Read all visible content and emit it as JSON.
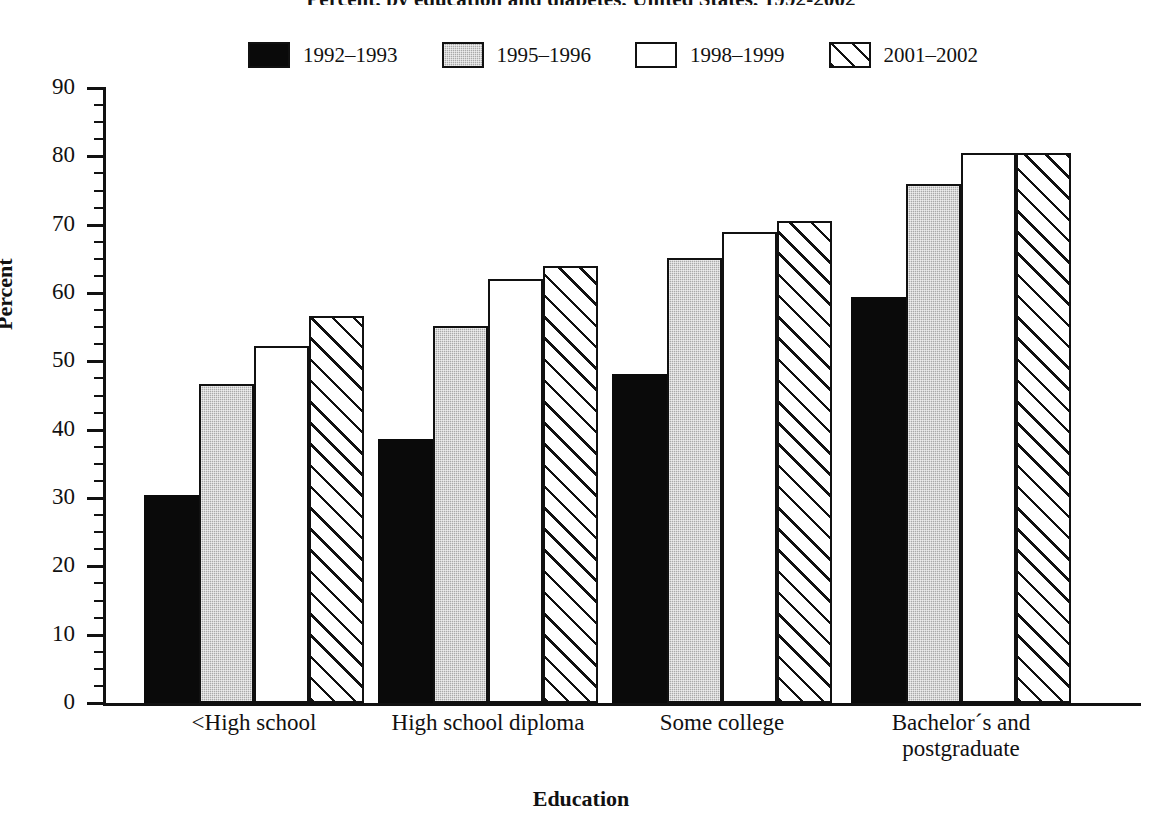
{
  "chart_data": {
    "type": "bar",
    "title": "Percent, by education and diabetes, United States, 1992-2002",
    "xlabel": "Education",
    "ylabel": "Percent",
    "ylim": [
      0,
      90
    ],
    "ytick_step": 10,
    "yticks": [
      "90",
      "80",
      "70",
      "60",
      "50",
      "40",
      "30",
      "20",
      "10",
      "0"
    ],
    "grid": false,
    "legend_position": "top",
    "categories": [
      "<High school",
      "High school diploma",
      "Some college",
      "Bachelor´s and\npostgraduate"
    ],
    "category_lines": [
      [
        "<High school"
      ],
      [
        "High school diploma"
      ],
      [
        "Some college"
      ],
      [
        "Bachelor´s and",
        "postgraduate"
      ]
    ],
    "series": [
      {
        "name": "1992–1993",
        "fill": "solid",
        "color": "#0a0a0a",
        "values": [
          30.5,
          38.6,
          48.1,
          59.4
        ]
      },
      {
        "name": "1995–1996",
        "fill": "gray",
        "color": "#a9a9a9",
        "values": [
          46.7,
          55.1,
          65.1,
          75.9
        ]
      },
      {
        "name": "1998–1999",
        "fill": "white",
        "color": "#ffffff",
        "values": [
          52.3,
          62.0,
          69.0,
          80.5
        ]
      },
      {
        "name": "2001–2002",
        "fill": "hatch",
        "color": "#ffffff",
        "values": [
          56.7,
          64.0,
          70.6,
          80.5
        ]
      }
    ]
  }
}
